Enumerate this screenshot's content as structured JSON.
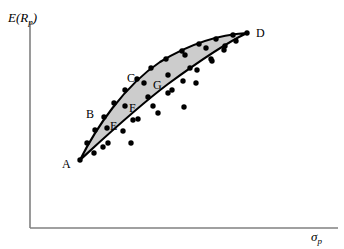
{
  "figure": {
    "background_color": "#ffffff",
    "region_fill_color": "#cccccc",
    "region_stroke_color": "#000000",
    "axis_color": "#808080",
    "dot_color": "#000000"
  },
  "axes": {
    "y_label_main": "E(R",
    "y_label_sub": "p",
    "y_label_close": ")",
    "x_label_main": "σ",
    "x_label_sub": "p",
    "y_axis_x": 30,
    "y_axis_top": 22,
    "y_axis_bottom": 228,
    "x_axis_left": 30,
    "x_axis_right": 338,
    "x_axis_y": 228
  },
  "labels": [
    {
      "name": "A",
      "text": "A",
      "x": 62,
      "y": 158
    },
    {
      "name": "B",
      "text": "B",
      "x": 86,
      "y": 108
    },
    {
      "name": "C",
      "text": "C",
      "x": 127,
      "y": 72
    },
    {
      "name": "D",
      "text": "D",
      "x": 256,
      "y": 27
    },
    {
      "name": "E",
      "text": "E",
      "x": 110,
      "y": 120
    },
    {
      "name": "F",
      "text": "F",
      "x": 129,
      "y": 102
    },
    {
      "name": "G",
      "text": "G",
      "x": 153,
      "y": 79
    }
  ],
  "chart_data": {
    "type": "scatter",
    "title": "",
    "xlabel": "σp",
    "ylabel": "E(Rp)",
    "grid": false,
    "legend": false,
    "annotations": [
      "A",
      "B",
      "C",
      "D",
      "E",
      "F",
      "G"
    ],
    "region": {
      "name": "feasible-set",
      "shape": "lens",
      "fill": "#cccccc",
      "vertices": [
        [
          80,
          160
        ],
        [
          247,
          33
        ]
      ],
      "upper_edge_path": "M 80,160 C 96,128 124,86 160,62 C 196,40 228,34 247,33",
      "lower_edge_path": "M 247,33 C 228,42 198,62 168,84 C 136,108 104,138 80,160"
    },
    "boundary_points": [
      {
        "x": 80,
        "y": 160
      },
      {
        "x": 87,
        "y": 143
      },
      {
        "x": 95,
        "y": 130
      },
      {
        "x": 104,
        "y": 117
      },
      {
        "x": 114,
        "y": 103
      },
      {
        "x": 125,
        "y": 90
      },
      {
        "x": 137,
        "y": 79
      },
      {
        "x": 151,
        "y": 68
      },
      {
        "x": 166,
        "y": 59
      },
      {
        "x": 182,
        "y": 51
      },
      {
        "x": 199,
        "y": 44
      },
      {
        "x": 216,
        "y": 39
      },
      {
        "x": 233,
        "y": 35
      },
      {
        "x": 247,
        "y": 33
      },
      {
        "x": 236,
        "y": 41
      },
      {
        "x": 224,
        "y": 50
      },
      {
        "x": 211,
        "y": 59
      },
      {
        "x": 197,
        "y": 70
      },
      {
        "x": 183,
        "y": 81
      },
      {
        "x": 168,
        "y": 93
      },
      {
        "x": 153,
        "y": 106
      },
      {
        "x": 138,
        "y": 119
      },
      {
        "x": 123,
        "y": 131
      },
      {
        "x": 108,
        "y": 143
      },
      {
        "x": 94,
        "y": 153
      }
    ],
    "interior_points": [
      {
        "x": 103,
        "y": 147
      },
      {
        "x": 131,
        "y": 143
      },
      {
        "x": 107,
        "y": 128
      },
      {
        "x": 133,
        "y": 120
      },
      {
        "x": 158,
        "y": 113
      },
      {
        "x": 184,
        "y": 107
      },
      {
        "x": 125,
        "y": 106
      },
      {
        "x": 148,
        "y": 97
      },
      {
        "x": 172,
        "y": 90
      },
      {
        "x": 196,
        "y": 83
      },
      {
        "x": 144,
        "y": 83
      },
      {
        "x": 168,
        "y": 75
      },
      {
        "x": 190,
        "y": 68
      },
      {
        "x": 212,
        "y": 61
      },
      {
        "x": 185,
        "y": 55
      },
      {
        "x": 206,
        "y": 48
      },
      {
        "x": 225,
        "y": 46
      }
    ]
  }
}
